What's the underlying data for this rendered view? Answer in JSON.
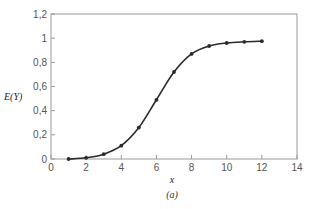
{
  "chart_data": {
    "type": "line",
    "title": "",
    "caption": "(a)",
    "xlabel": "x",
    "ylabel": "E(Y)",
    "xlim": [
      0,
      14
    ],
    "ylim": [
      0,
      1.2
    ],
    "xticks": [
      0,
      2,
      4,
      6,
      8,
      10,
      12,
      14
    ],
    "xtick_labels": [
      "0",
      "2",
      "4",
      "6",
      "8",
      "10",
      "12",
      "14"
    ],
    "yticks": [
      0,
      0.2,
      0.4,
      0.6,
      0.8,
      1.0,
      1.2
    ],
    "ytick_labels": [
      "0",
      "0,2",
      "0,4",
      "0,6",
      "0,8",
      "1",
      "1,2"
    ],
    "grid": false,
    "legend": null,
    "series": [
      {
        "name": "E(Y)",
        "color": "#2a2a2a",
        "marker": "circle",
        "x": [
          1,
          2,
          3,
          4,
          5,
          6,
          7,
          8,
          9,
          10,
          11,
          12
        ],
        "values": [
          0.0,
          0.01,
          0.04,
          0.11,
          0.26,
          0.49,
          0.72,
          0.87,
          0.935,
          0.96,
          0.97,
          0.975
        ]
      }
    ]
  },
  "colors": {
    "axis": "#9a9a9a",
    "line": "#2a2a2a",
    "background": "#ffffff"
  }
}
